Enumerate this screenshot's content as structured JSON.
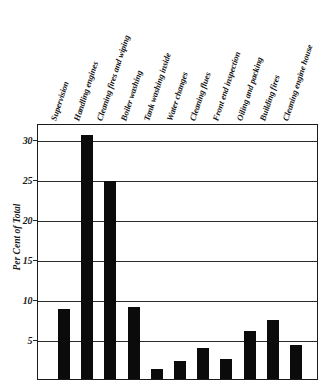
{
  "chart_data": {
    "type": "bar",
    "title": "",
    "xlabel": "",
    "ylabel": "Per Cent of Total",
    "ylim": [
      0,
      32
    ],
    "grid": true,
    "legend": "none",
    "yticks": [
      5,
      10,
      15,
      20,
      25,
      30
    ],
    "ytick_labels": [
      "5",
      "10",
      "15",
      "20",
      "25",
      "30"
    ],
    "categories": [
      "Supervision",
      "Handling engines",
      "Cleaning fires and wiping",
      "Boiler washing",
      "Tank washing inside",
      "Water changes",
      "Cleaning flues",
      "Front end inspection",
      "Oiling and packing",
      "Building fires",
      "Cleaning engine house"
    ],
    "values": [
      8.8,
      30.5,
      24.8,
      9.0,
      1.3,
      2.3,
      3.9,
      2.5,
      6.0,
      7.4,
      4.3
    ],
    "bar_color": "#0b0b0b"
  }
}
